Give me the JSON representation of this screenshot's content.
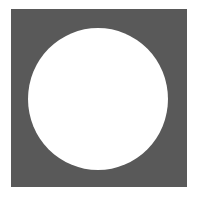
{
  "figure": {
    "shape": "square-with-circular-cutout",
    "colors": {
      "square": "#595959",
      "circle": "#ffffff",
      "background": "#ffffff"
    }
  }
}
